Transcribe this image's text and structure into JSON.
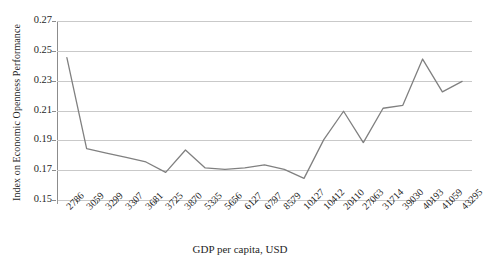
{
  "chart_data": {
    "type": "line",
    "title": "",
    "xlabel": "GDP per capita, USD",
    "ylabel": "Index on Economic Openness Performance",
    "categories": [
      "2786",
      "3059",
      "3299",
      "3307",
      "3681",
      "3725",
      "3870",
      "5335",
      "5656",
      "6127",
      "6797",
      "8579",
      "10127",
      "10412",
      "20110",
      "27063",
      "31714",
      "39030",
      "40193",
      "41059",
      "43295"
    ],
    "x": [
      2786,
      3059,
      3299,
      3307,
      3681,
      3725,
      3870,
      5335,
      5656,
      6127,
      6797,
      8579,
      10127,
      10412,
      20110,
      27063,
      31714,
      39030,
      40193,
      41059,
      43295
    ],
    "values": [
      0.2455,
      0.1845,
      0.1815,
      0.1785,
      0.1755,
      0.1685,
      0.1835,
      0.1715,
      0.1705,
      0.1715,
      0.1735,
      0.1705,
      0.1645,
      0.1905,
      0.2095,
      0.1885,
      0.2115,
      0.2135,
      0.2445,
      0.2225,
      0.2295
    ],
    "series": [
      {
        "name": "Index on Economic Openness Performance",
        "values": [
          0.2455,
          0.1845,
          0.1815,
          0.1785,
          0.1755,
          0.1685,
          0.1835,
          0.1715,
          0.1705,
          0.1715,
          0.1735,
          0.1705,
          0.1645,
          0.1905,
          0.2095,
          0.1885,
          0.2115,
          0.2135,
          0.2445,
          0.2225,
          0.2295
        ],
        "color": "#808080"
      }
    ],
    "ylim": [
      0.15,
      0.27
    ],
    "yticks": [
      0.15,
      0.17,
      0.19,
      0.21,
      0.23,
      0.25,
      0.27
    ],
    "ytick_labels": [
      "0.15",
      "0.17",
      "0.19",
      "0.21",
      "0.23",
      "0.25",
      "0.27"
    ],
    "grid": true,
    "grid_color": "#c9c9c9",
    "legend": "none",
    "line_color": "#808080",
    "axis_color": "#8c8c8c",
    "background": "#ffffff"
  }
}
